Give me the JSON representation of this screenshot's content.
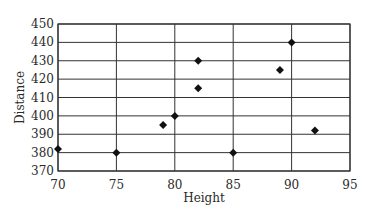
{
  "chart_data": {
    "type": "scatter",
    "title": "",
    "xlabel": "Height",
    "ylabel": "Distance",
    "xlim": [
      70,
      95
    ],
    "ylim": [
      370,
      450
    ],
    "xticks": [
      70,
      75,
      80,
      85,
      90,
      95
    ],
    "yticks": [
      370,
      380,
      390,
      400,
      410,
      420,
      430,
      440,
      450
    ],
    "grid": true,
    "legend": null,
    "marker": "diamond",
    "marker_color": "#111111",
    "grid_color": "#333333",
    "points": [
      {
        "x": 70,
        "y": 382
      },
      {
        "x": 75,
        "y": 380
      },
      {
        "x": 79,
        "y": 395
      },
      {
        "x": 80,
        "y": 400
      },
      {
        "x": 82,
        "y": 430
      },
      {
        "x": 82,
        "y": 415
      },
      {
        "x": 85,
        "y": 380
      },
      {
        "x": 89,
        "y": 425
      },
      {
        "x": 90,
        "y": 440
      },
      {
        "x": 92,
        "y": 392
      }
    ]
  }
}
